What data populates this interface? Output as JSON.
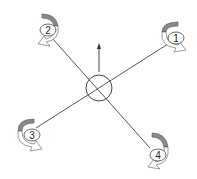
{
  "diagram": {
    "type": "quadcopter-x-configuration",
    "center_body": {
      "shape": "circle"
    },
    "forward_arrow": {
      "direction": "up"
    },
    "rotors": [
      {
        "id": "1",
        "label": "1",
        "position": "top-right"
      },
      {
        "id": "2",
        "label": "2",
        "position": "top-left"
      },
      {
        "id": "3",
        "label": "3",
        "position": "bottom-left"
      },
      {
        "id": "4",
        "label": "4",
        "position": "bottom-right"
      }
    ],
    "colors": {
      "line": "#444444",
      "arrow_fill_dark": "#8a8a8a",
      "arrow_fill_light": "#ffffff",
      "background": "#ffffff"
    }
  }
}
